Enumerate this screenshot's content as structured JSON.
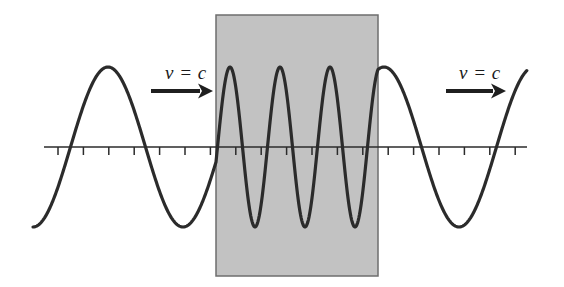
{
  "figure": {
    "background_color": "#ffffff",
    "width": 564,
    "height": 287
  },
  "chart_data": {
    "type": "line",
    "title": "",
    "xlabel": "",
    "ylabel": "",
    "grid": false,
    "legend": "none",
    "xlim": [
      0,
      564
    ],
    "ylim": [
      287,
      0
    ],
    "axis": {
      "y_pixel": 147,
      "x_start": 44,
      "x_end": 527,
      "tick_spacing": 25.4,
      "tick_length": 8,
      "tick_direction": "down",
      "tick_count": 20,
      "color": "#2b2b2b"
    },
    "wave": {
      "color": "#2b2b2b",
      "line_width": 3.2,
      "amplitude": 80,
      "baseline": 147,
      "segments": [
        {
          "name": "incident",
          "region": "vacuum-left",
          "x_start": 33,
          "x_end": 216,
          "wavelength": 150,
          "phase_note": "begins at a trough near x=33"
        },
        {
          "name": "transmitted",
          "region": "medium-slab",
          "x_start": 216,
          "x_end": 378,
          "wavelength": 50,
          "cycles": 3,
          "phase_note": "three compressed full cycles inside the slab"
        },
        {
          "name": "emergent",
          "region": "vacuum-right",
          "x_start": 378,
          "x_end": 527,
          "wavelength": 150,
          "phase_note": "peak near x=408, trough near x=480, rising at right edge"
        }
      ]
    },
    "slab": {
      "label": "medium",
      "x": 216,
      "y": 15,
      "width": 162,
      "height": 261,
      "fill_color": "#c2c2c2",
      "border_color": "#6e6e6e",
      "border_width": 1.5
    },
    "annotations": [
      {
        "id": "left-velocity-label",
        "text": "v = c",
        "x": 165,
        "y": 62,
        "arrow": {
          "x_start": 151,
          "x_end": 213,
          "y": 91,
          "direction": "right"
        }
      },
      {
        "id": "right-velocity-label",
        "text": "v = c",
        "x": 459,
        "y": 62,
        "arrow": {
          "x_start": 446,
          "x_end": 506,
          "y": 91,
          "direction": "right"
        }
      }
    ]
  },
  "labels": {
    "left_velocity": "v = c",
    "right_velocity": "v = c"
  }
}
